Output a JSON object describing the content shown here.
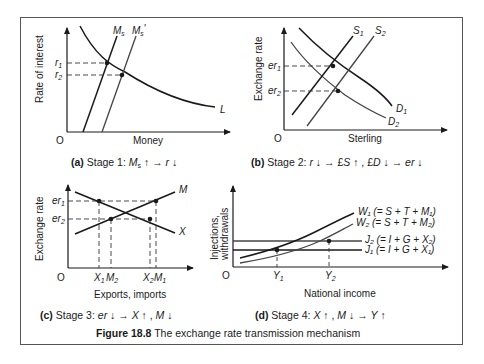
{
  "figure": {
    "number_label": "Figure 18.8",
    "title": "The exchange rate transmission mechanism"
  },
  "panels": {
    "a": {
      "tag": "(a)",
      "caption": "Stage 1: ",
      "caption_math": [
        "M",
        "s",
        " ↑ → ",
        "r",
        " ↓"
      ],
      "ylabel": "Rate of interest",
      "xlabel": "Money",
      "origin": "O",
      "curves": {
        "ms": "M",
        "ms_sub": "s",
        "ms2": "M",
        "ms2_sub": "s",
        "ms2_prime": "'",
        "l": "L"
      },
      "ticks": {
        "r1": "r",
        "r1_sub": "1",
        "r2": "r",
        "r2_sub": "2"
      }
    },
    "b": {
      "tag": "(b)",
      "caption": "Stage 2: ",
      "caption_math": [
        "r",
        " ↓ → £",
        "S",
        " ↑ , £",
        "D",
        " ↓ → ",
        "er",
        " ↓"
      ],
      "ylabel": "Exchange rate",
      "xlabel": "Sterling",
      "origin": "O",
      "curves": {
        "s1": "S",
        "s1_sub": "1",
        "s2": "S",
        "s2_sub": "2",
        "d1": "D",
        "d1_sub": "1",
        "d2": "D",
        "d2_sub": "2"
      },
      "ticks": {
        "er1": "er",
        "er1_sub": "1",
        "er2": "er",
        "er2_sub": "2"
      }
    },
    "c": {
      "tag": "(c)",
      "caption": "Stage 3: ",
      "caption_math": [
        "er",
        " ↓ → ",
        "X",
        " ↑ , ",
        "M",
        " ↓"
      ],
      "ylabel": "Exchange rate",
      "xlabel": "Exports, imports",
      "origin": "O",
      "curves": {
        "m": "M",
        "x": "X"
      },
      "ticks": {
        "er1": "er",
        "er1_sub": "1",
        "er2": "er",
        "er2_sub": "2",
        "x1": "X",
        "x1_sub": "1",
        "m2": "M",
        "m2_sub": "2",
        "x2": "X",
        "x2_sub": "2",
        "m1": "M",
        "m1_sub": "1"
      }
    },
    "d": {
      "tag": "(d)",
      "caption": "Stage 4: ",
      "caption_math": [
        "X",
        " ↑ , ",
        "M",
        " ↓ → ",
        "Y",
        " ↑"
      ],
      "ylabel_line1": "Injections,",
      "ylabel_line2": "withdrawals",
      "xlabel": "National income",
      "origin": "O",
      "curves": {
        "w1": "W₁ (= S + T + M₁)",
        "w2": "W₂ (= S + T + M₂)",
        "j2": "J₂ (= I + G + X₂)",
        "j1": "J₁ (= I + G + X₁)"
      },
      "ticks": {
        "y1": "Y",
        "y1_sub": "1",
        "y2": "Y",
        "y2_sub": "2"
      }
    }
  }
}
